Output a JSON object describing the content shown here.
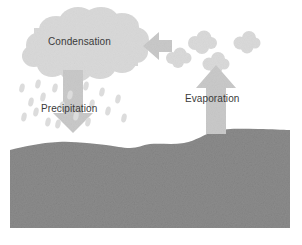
{
  "diagram": {
    "width": 302,
    "height": 245,
    "background_color": "#ffffff"
  },
  "labels": {
    "condensation": "Condensation",
    "precipitation": "Precipitation",
    "evaporation": "Evaporation"
  },
  "colors": {
    "cloud": "#d9d9d9",
    "cloud_edge": "#d2d2d2",
    "arrow": "#c9c9c9",
    "raindrop": "#dcdcdc",
    "vapor_puff": "#dadada",
    "ground": "#8c8c8c",
    "ground_dark": "#7f7f7f",
    "text": "#3a3a3a"
  },
  "elements": {
    "cloud": "condensation-cloud",
    "down_arrow": "precipitation-arrow",
    "up_arrow": "evaporation-arrow",
    "left_arrow": "vapor-transport-arrow",
    "ground": "ground-water-body",
    "raindrop_count": 19,
    "vapor_puff_count": 4
  },
  "raindrops": [
    {
      "x": 22,
      "y": 88
    },
    {
      "x": 31,
      "y": 102
    },
    {
      "x": 24,
      "y": 117
    },
    {
      "x": 38,
      "y": 84
    },
    {
      "x": 43,
      "y": 97
    },
    {
      "x": 36,
      "y": 112
    },
    {
      "x": 48,
      "y": 122
    },
    {
      "x": 55,
      "y": 88
    },
    {
      "x": 62,
      "y": 106
    },
    {
      "x": 58,
      "y": 124
    },
    {
      "x": 70,
      "y": 95
    },
    {
      "x": 76,
      "y": 116
    },
    {
      "x": 86,
      "y": 86
    },
    {
      "x": 92,
      "y": 104
    },
    {
      "x": 88,
      "y": 122
    },
    {
      "x": 102,
      "y": 92
    },
    {
      "x": 108,
      "y": 111
    },
    {
      "x": 118,
      "y": 99
    },
    {
      "x": 124,
      "y": 118
    }
  ],
  "vapor_puffs": [
    {
      "x": 177,
      "y": 56,
      "r": 9
    },
    {
      "x": 201,
      "y": 41,
      "r": 11
    },
    {
      "x": 215,
      "y": 62,
      "r": 10
    },
    {
      "x": 246,
      "y": 41,
      "r": 10
    }
  ]
}
